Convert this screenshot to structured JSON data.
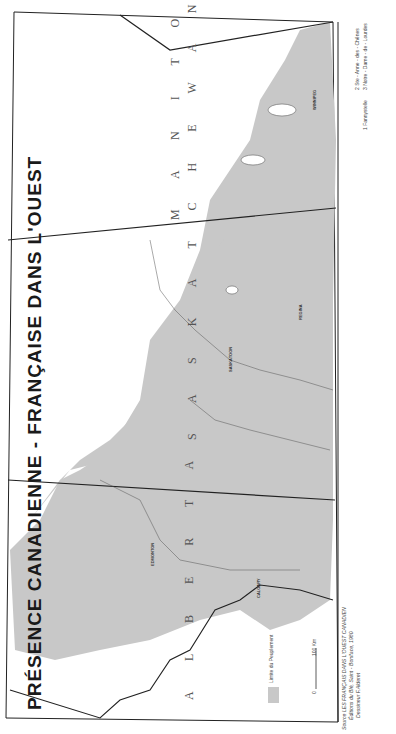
{
  "map": {
    "title": "PRÉSENCE CANADIENNE - FRANÇAISE DANS L'OUEST",
    "provinces": [
      {
        "name": "ALBERTA",
        "label": "A L B E R T A"
      },
      {
        "name": "SASKATCHEWAN",
        "label": "S A S K A T C H E W A N"
      },
      {
        "name": "MANITOBA",
        "label": "M A N I T O B A"
      }
    ],
    "cities": [
      "EDMONTON",
      "SASKATOON",
      "CALGARY",
      "REGINA",
      "WINNIPEG"
    ],
    "places_alberta": [
      "Bonnyville",
      "St-Paul",
      "Lac La Biche",
      "Plamondon",
      "Morinville",
      "Legal",
      "St. Albert",
      "Beaumont",
      "Leduc",
      "Falher",
      "Girouxville",
      "Donnelly",
      "McLennan",
      "Peace River",
      "Red Deer",
      "Trochu",
      "High River",
      "Medicine Hat"
    ],
    "places_saskatchewan": [
      "Prince Albert",
      "Zenon Park",
      "Bellevue",
      "St. Louis",
      "Domremy",
      "Duck Lake",
      "North Battleford",
      "Biggar",
      "Rosetown",
      "Gravelbourg",
      "Ponteix",
      "Willow Bunch",
      "Bellegarde",
      "Ste-Marthe",
      "Debden",
      "Delmas",
      "Vonda",
      "St. Denis",
      "Prud'homme",
      "Bruno",
      "Ferland",
      "Lafleche",
      "Val Marie"
    ],
    "places_manitoba": [
      "St-Boniface",
      "St-Laurent",
      "St-Pierre",
      "Ste-Rose-du-Lac",
      "Laurier",
      "McCreary",
      "St-Lazare",
      "Lorette",
      "La Broquerie",
      "Letellier",
      "St-Jean-Baptiste",
      "Ste-Agathe",
      "Portage",
      "St-Claude",
      "St-Jean",
      "Mariapolis",
      "Swan Lake",
      "Somerset"
    ],
    "footnotes": [
      "1  Fannystelle",
      "2  Ste - Anne - des - Chênes",
      "3  Notre - Dame - de - Lourdes"
    ],
    "legend": {
      "label": "Limite du Peuplement",
      "swatch_color": "#c8c8c8"
    },
    "scale": {
      "zero": "0",
      "max": "100 Km"
    },
    "source": {
      "line1": "Source  LES  FRANÇAIS  DANS  L'OUEST  CANADIEN",
      "line2": "Éditions  du  Blé,  Saint - Boniface,  1980",
      "line3": "Dessineur  F.Alderet"
    },
    "colors": {
      "settled_area": "#c8c8c8",
      "border": "#222222",
      "paper": "#ffffff"
    }
  }
}
